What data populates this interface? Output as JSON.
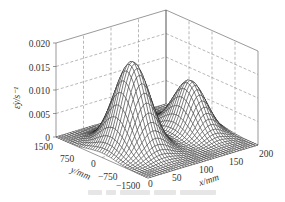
{
  "chart_data": {
    "type": "surface3d",
    "title": "",
    "zlabel": "ε̇y/s⁻¹",
    "xlabel": "x/mm",
    "ylabel": "y/mm",
    "z_ticks": [
      "0",
      "0.005",
      "0.010",
      "0.015",
      "0.020"
    ],
    "z_tick_values": [
      0,
      0.005,
      0.01,
      0.015,
      0.02
    ],
    "x_ticks": [
      "0",
      "50",
      "100",
      "150",
      "200"
    ],
    "x_tick_values": [
      0,
      50,
      100,
      150,
      200
    ],
    "y_ticks": [
      "1500",
      "750",
      "0",
      "−750",
      "−1500"
    ],
    "y_tick_values": [
      1500,
      750,
      0,
      -750,
      -1500
    ],
    "xlim": [
      0,
      200
    ],
    "ylim": [
      -1500,
      1500
    ],
    "zlim": [
      0,
      0.02
    ],
    "grid": true,
    "surface_description": "Two ridges along y centered at y=0: major peak near x≈50 mm (z≈0.019 s^-1), minor peak near x≈160 mm (z≈0.011 s^-1), saddle near x≈110 mm",
    "peaks": [
      {
        "x": 50,
        "y": 0,
        "z": 0.019
      },
      {
        "x": 160,
        "y": 0,
        "z": 0.011
      }
    ],
    "colors": {
      "mesh": "#1a1a1a",
      "axes": "#555555",
      "grid": "#888888"
    }
  },
  "caption": {
    "visible_text": ""
  }
}
